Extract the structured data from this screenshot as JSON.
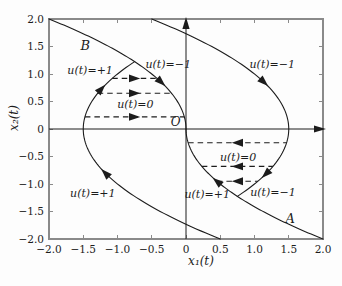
{
  "figure": {
    "background": "#fdfdfd",
    "ink_color": "#1c1c1c",
    "frame_color": "#8a8a8a"
  },
  "chart_data": {
    "type": "line",
    "title": "",
    "xlabel": "x₁(t)",
    "ylabel": "x₂(t)",
    "xlim": [
      -2,
      2
    ],
    "ylim": [
      -2,
      2
    ],
    "grid": false,
    "legend": "none",
    "plot_area": {
      "left": 49,
      "top": 19,
      "right": 323,
      "bottom": 239
    },
    "xticks": {
      "values": [
        -2,
        -1.5,
        -1,
        -0.5,
        0,
        0.5,
        1,
        1.5,
        2
      ],
      "labels": [
        "−2.0",
        "−1.5",
        "−1.0",
        "−0.5",
        "0",
        "0.5",
        "1.0",
        "1.5",
        "2.0"
      ]
    },
    "yticks": {
      "values": [
        -2,
        -1.5,
        -1,
        -0.5,
        0,
        0.5,
        1,
        1.5,
        2
      ],
      "labels": [
        "−2.0",
        "−1.5",
        "−1.0",
        "−0.5",
        "0",
        "0.5",
        "1.0",
        "1.5",
        "2.0"
      ]
    },
    "axes": {
      "x_arrow": true,
      "y_arrow": true
    },
    "curves": [
      {
        "name": "switching-curve-B",
        "equation": "x1 = -x2^2/2",
        "a": -0.5,
        "c": 0,
        "y_range": [
          0,
          2
        ],
        "arrows": [
          {
            "y": 0.85,
            "motion": "decreasing-y"
          }
        ]
      },
      {
        "name": "switching-curve-A",
        "equation": "x1 = x2^2/2",
        "a": 0.5,
        "c": 0,
        "y_range": [
          -2,
          0
        ],
        "arrows": [
          {
            "y": -0.95,
            "motion": "increasing-y"
          }
        ]
      },
      {
        "name": "trajectory-u-plus-1",
        "equation": "x1 = x2^2/2 - 1.5",
        "a": 0.5,
        "c": -1.5,
        "y_range": [
          -2,
          1.2247
        ],
        "arrows": [
          {
            "y": -0.8,
            "motion": "increasing-y"
          },
          {
            "y": 0.73,
            "motion": "increasing-y"
          }
        ]
      },
      {
        "name": "trajectory-u-minus-1",
        "equation": "x1 = 1.5 - x2^2/2",
        "a": -0.5,
        "c": 1.5,
        "y_range": [
          -1.2247,
          2
        ],
        "arrows": [
          {
            "y": 0.85,
            "motion": "decreasing-y"
          },
          {
            "y": -0.82,
            "motion": "decreasing-y"
          }
        ]
      }
    ],
    "coast_segments": [
      {
        "y": 0.92,
        "x_from": -1.0768,
        "x_to": -0.4232,
        "direction": "right"
      },
      {
        "y": 0.65,
        "x_from": -1.2888,
        "x_to": -0.2113,
        "direction": "right"
      },
      {
        "y": 0.22,
        "x_from": -1.4758,
        "x_to": -0.0242,
        "direction": "right"
      },
      {
        "y": -0.25,
        "x_from": 0.0313,
        "x_to": 1.4688,
        "direction": "left"
      },
      {
        "y": -0.68,
        "x_from": 0.2313,
        "x_to": 1.2688,
        "direction": "left"
      },
      {
        "y": -0.95,
        "x_from": 0.4513,
        "x_to": 1.0488,
        "direction": "left"
      }
    ],
    "annotations": [
      {
        "name": "label-curve-B",
        "text": "B",
        "x": -1.47,
        "y": 1.52,
        "size": 13
      },
      {
        "name": "label-curve-A",
        "text": "A",
        "x": 1.52,
        "y": -1.63,
        "size": 13
      },
      {
        "name": "label-origin",
        "text": "O",
        "x": -0.15,
        "y": 0.14,
        "size": 12
      },
      {
        "name": "label-u-plus-upper-left",
        "text": "u(t)=+1",
        "x": -1.4,
        "y": 1.07,
        "size": 11
      },
      {
        "name": "label-u-minus-upper-mid",
        "text": "u(t)=−1",
        "x": -0.26,
        "y": 1.18,
        "size": 11
      },
      {
        "name": "label-u-zero-upper",
        "text": "u(t)=0",
        "x": -0.74,
        "y": 0.45,
        "size": 11
      },
      {
        "name": "label-u-minus-upper-right",
        "text": "u(t)=−1",
        "x": 1.26,
        "y": 1.18,
        "size": 11
      },
      {
        "name": "label-u-plus-lower-left",
        "text": "u(t)=+1",
        "x": -1.36,
        "y": -1.17,
        "size": 11
      },
      {
        "name": "label-u-plus-lower-mid",
        "text": "u(t)=+1",
        "x": 0.31,
        "y": -1.18,
        "size": 11
      },
      {
        "name": "label-u-minus-lower-right",
        "text": "u(t)=−1",
        "x": 1.27,
        "y": -1.15,
        "size": 11
      },
      {
        "name": "label-u-zero-lower",
        "text": "u(t)=0",
        "x": 0.76,
        "y": -0.51,
        "size": 11
      }
    ]
  }
}
